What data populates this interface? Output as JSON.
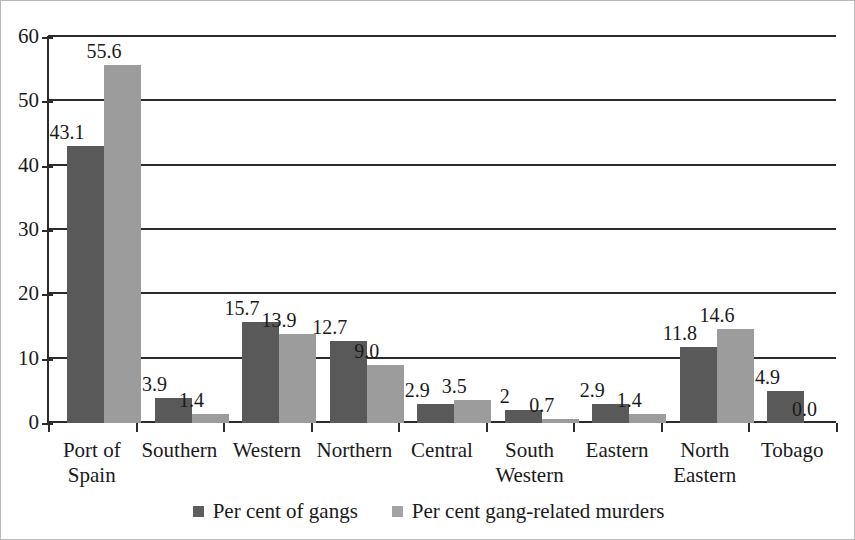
{
  "chart_data": {
    "type": "bar",
    "title": "",
    "subtitle": "",
    "xlabel": "",
    "ylabel": "",
    "ylim": [
      0,
      60
    ],
    "yticks": [
      0,
      10,
      20,
      30,
      40,
      50,
      60
    ],
    "ytick_labels": [
      "0",
      "10",
      "20",
      "30",
      "40",
      "50",
      "60"
    ],
    "grid": true,
    "grid_axis": "y",
    "legend_position": "bottom-center",
    "categories": [
      "Port of Spain",
      "Southern",
      "Western",
      "Northern",
      "Central",
      "South Western",
      "Eastern",
      "North Eastern",
      "Tobago"
    ],
    "category_lines": [
      [
        "Port of",
        "Spain"
      ],
      [
        "Southern",
        ""
      ],
      [
        "Western",
        ""
      ],
      [
        "Northern",
        ""
      ],
      [
        "Central",
        ""
      ],
      [
        "South",
        "Western"
      ],
      [
        "Eastern",
        ""
      ],
      [
        "North",
        "Eastern"
      ],
      [
        "Tobago",
        ""
      ]
    ],
    "series": [
      {
        "name": "Per cent of gangs",
        "color": "#5e5e5e",
        "values": [
          43.1,
          3.9,
          15.7,
          12.7,
          2.9,
          2,
          2.9,
          11.8,
          4.9
        ],
        "labels": [
          "43.1",
          "3.9",
          "15.7",
          "12.7",
          "2.9",
          "2",
          "2.9",
          "11.8",
          "4.9"
        ]
      },
      {
        "name": "Per cent gang-related murders",
        "color": "#a3a3a3",
        "values": [
          55.6,
          1.4,
          13.9,
          9.0,
          3.5,
          0.7,
          1.4,
          14.6,
          0.0
        ],
        "labels": [
          "55.6",
          "1.4",
          "13.9",
          "9.0",
          "3.5",
          "0.7",
          "1.4",
          "14.6",
          "0.0"
        ]
      }
    ]
  }
}
